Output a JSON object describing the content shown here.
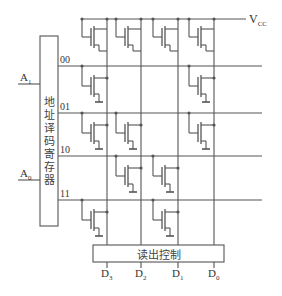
{
  "supply_label": "V",
  "supply_sub": "CC",
  "decoder": {
    "label_chars": [
      "地",
      "址",
      "译",
      "码",
      "寄",
      "存",
      "器"
    ],
    "inputs": [
      {
        "name": "A",
        "sub": "1"
      },
      {
        "name": "A",
        "sub": "0"
      }
    ]
  },
  "rows": [
    {
      "address": "00",
      "cells": [
        1,
        0,
        0,
        1
      ]
    },
    {
      "address": "01",
      "cells": [
        1,
        1,
        0,
        1
      ]
    },
    {
      "address": "10",
      "cells": [
        0,
        1,
        1,
        0
      ]
    },
    {
      "address": "11",
      "cells": [
        1,
        0,
        1,
        0
      ]
    }
  ],
  "readout": {
    "label": "读出控制",
    "outputs": [
      {
        "name": "D",
        "sub": "3"
      },
      {
        "name": "D",
        "sub": "2"
      },
      {
        "name": "D",
        "sub": "1"
      },
      {
        "name": "D",
        "sub": "0"
      }
    ]
  },
  "colors": {
    "line": "#555555",
    "text": "#333333"
  }
}
